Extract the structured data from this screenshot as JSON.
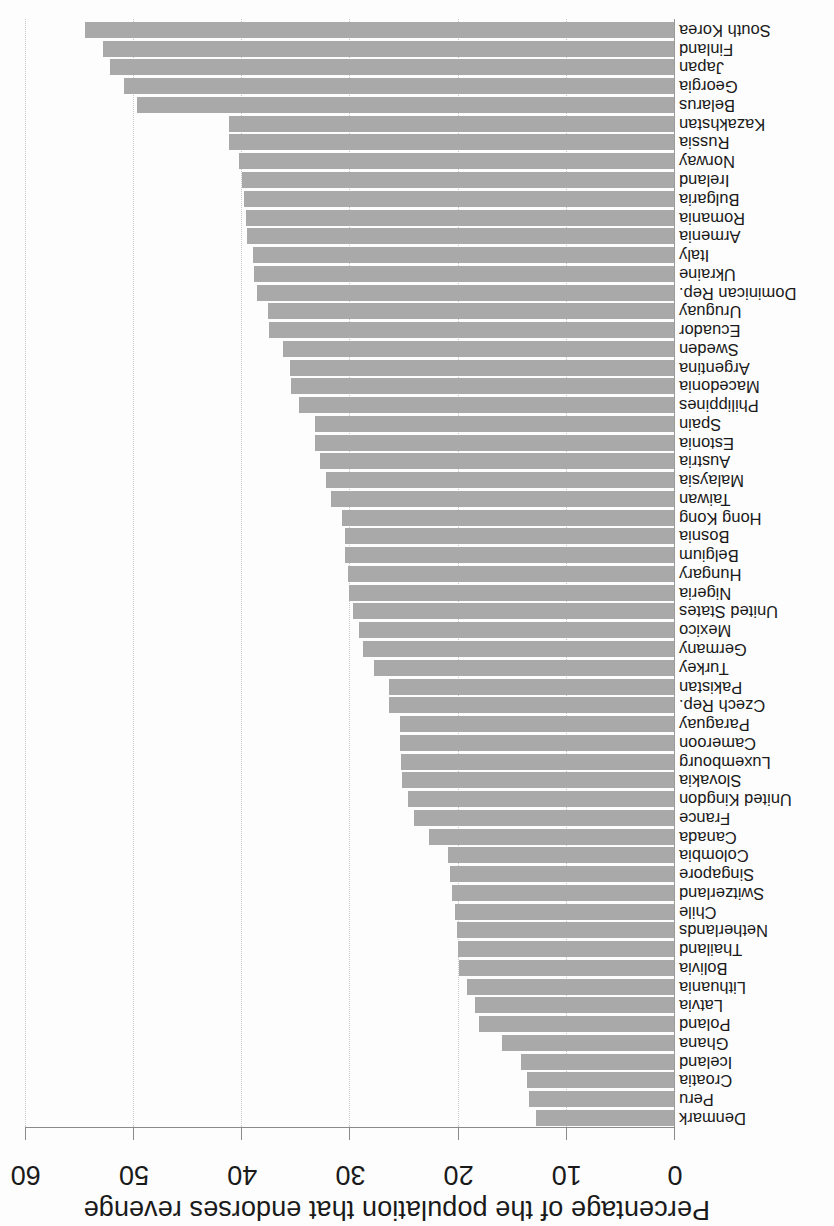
{
  "chart_data": {
    "type": "bar",
    "orientation": "horizontal",
    "image_rotated_degrees": 180,
    "title": "",
    "xlabel": "Percentage of the population that endorses revenge",
    "ylabel": "",
    "xlim": [
      0,
      60
    ],
    "xticks": [
      "0",
      "10",
      "20",
      "30",
      "40",
      "50",
      "60"
    ],
    "grid": "vertical dotted",
    "legend": null,
    "bar_color": "#a9a9a9",
    "categories": [
      "Denmark",
      "Peru",
      "Croatia",
      "Iceland",
      "Ghana",
      "Poland",
      "Latvia",
      "Lithuania",
      "Bolivia",
      "Thailand",
      "Netherlands",
      "Chile",
      "Switzerland",
      "Singapore",
      "Colombia",
      "Canada",
      "France",
      "United Kingdon",
      "Slovakia",
      "Luxembourg",
      "Cameroon",
      "Paraguay",
      "Czech Rep.",
      "Pakistan",
      "Turkey",
      "Germany",
      "Mexico",
      "United States",
      "Nigeria",
      "Hungary",
      "Belgium",
      "Bosnia",
      "Hong Kong",
      "Taiwan",
      "Malaysia",
      "Austria",
      "Estonia",
      "Spain",
      "Philippines",
      "Macedonia",
      "Argentina",
      "Sweden",
      "Ecuador",
      "Uruguay",
      "Dominican Rep.",
      "Ukraine",
      "Italy",
      "Armenia",
      "Romania",
      "Bulgaria",
      "Ireland",
      "Norway",
      "Russia",
      "Kazakhstan",
      "Belarus",
      "Georgia",
      "Japan",
      "Finland",
      "South Korea"
    ],
    "values": [
      12.8,
      13.4,
      13.6,
      14.1,
      15.9,
      18.0,
      18.4,
      19.1,
      19.9,
      20.0,
      20.1,
      20.2,
      20.5,
      20.7,
      20.9,
      22.6,
      24.0,
      24.6,
      25.1,
      25.2,
      25.3,
      25.3,
      26.3,
      26.3,
      27.7,
      28.7,
      29.1,
      29.7,
      30.0,
      30.1,
      30.4,
      30.4,
      30.7,
      31.7,
      32.2,
      32.7,
      33.2,
      33.2,
      34.7,
      35.4,
      35.5,
      36.1,
      37.4,
      37.5,
      38.5,
      38.8,
      38.9,
      39.5,
      39.6,
      39.7,
      39.9,
      40.2,
      41.1,
      41.1,
      49.6,
      50.8,
      52.1,
      52.8,
      54.4
    ]
  }
}
